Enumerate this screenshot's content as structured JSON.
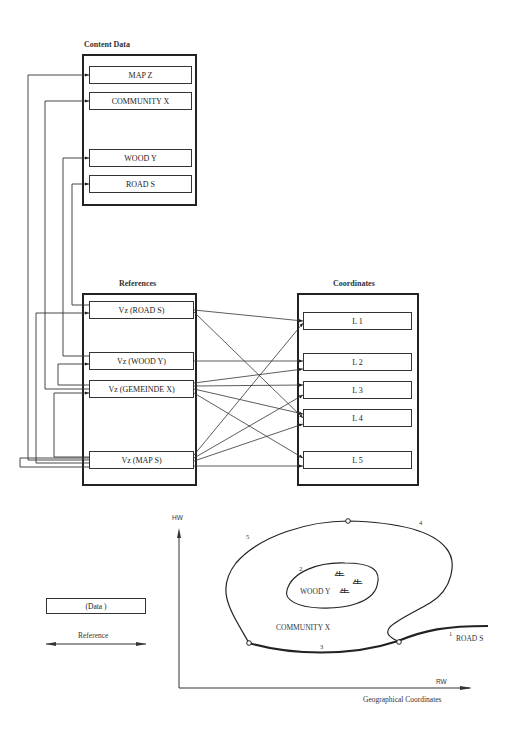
{
  "content_data": {
    "title": "Content Data",
    "items": [
      "MAP Z",
      "COMMUNITY X",
      "WOOD Y",
      "ROAD S"
    ]
  },
  "references": {
    "title": "References",
    "items": [
      "Vz (ROAD S)",
      "Vz (WOOD Y)",
      "Vz (GEMEINDE X)",
      "Vz (MAP S)"
    ]
  },
  "coordinates": {
    "title": "Coordinates",
    "items": [
      "L 1",
      "L 2",
      "L 3",
      "L 4",
      "L 5"
    ]
  },
  "legend": {
    "data_label": "(Data )",
    "reference_label": "Reference"
  },
  "map": {
    "y_axis": "HW",
    "x_axis": "RW",
    "caption": "Geographical Coordinates",
    "community": "COMMUNITY X",
    "wood": "WOOD Y",
    "road": "ROAD S",
    "line_numbers": [
      "1",
      "2",
      "3",
      "4",
      "5"
    ]
  }
}
